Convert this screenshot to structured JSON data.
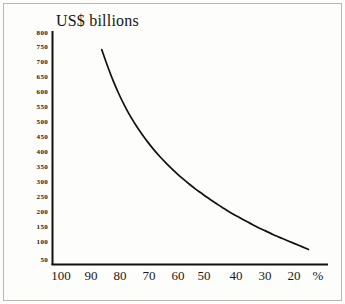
{
  "chart_data": {
    "type": "line",
    "title": "US$ billions",
    "xlabel": "%",
    "ylabel": "",
    "xlim": [
      104,
      13
    ],
    "ylim": [
      50,
      800
    ],
    "x_inverted": true,
    "grid": false,
    "legend": null,
    "x_tick_labels": [
      "100",
      "90",
      "80",
      "70",
      "60",
      "50",
      "40",
      "30",
      "20"
    ],
    "x_ticks": [
      100,
      90,
      80,
      70,
      60,
      50,
      40,
      30,
      20
    ],
    "y_tick_labels": [
      "800",
      "750",
      "700",
      "650",
      "600",
      "550",
      "500",
      "450",
      "400",
      "350",
      "300",
      "250",
      "200",
      "150",
      "100",
      "50"
    ],
    "y_ticks": [
      800,
      750,
      700,
      650,
      600,
      550,
      500,
      450,
      400,
      350,
      300,
      250,
      200,
      150,
      100,
      50
    ],
    "axis_unit_label": "%",
    "series": [
      {
        "name": "US$ billions",
        "color": "#111111",
        "x": [
          86,
          84,
          82,
          80,
          78,
          76,
          74,
          72,
          70,
          68,
          66,
          64,
          62,
          60,
          58,
          56,
          54,
          52,
          50,
          48,
          46,
          44,
          42,
          40,
          38,
          36,
          34,
          32,
          30,
          28,
          26,
          24,
          22,
          20,
          18,
          16,
          15
        ],
        "y": [
          745,
          690,
          640,
          596,
          557,
          522,
          491,
          463,
          437,
          413,
          391,
          371,
          352,
          334,
          317,
          301,
          286,
          272,
          258,
          245,
          232,
          220,
          208,
          197,
          186,
          176,
          166,
          156,
          147,
          138,
          129,
          121,
          113,
          105,
          97,
          89,
          85
        ]
      }
    ]
  },
  "figure": {
    "title": "US$ billions",
    "unit": "%"
  }
}
